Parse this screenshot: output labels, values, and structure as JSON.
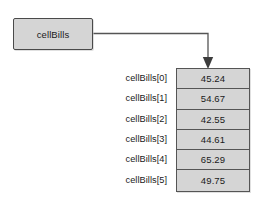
{
  "diagram": {
    "type": "array-reference-diagram",
    "reference": {
      "name": "cellBills",
      "label": "cellBills"
    },
    "arrow": {
      "icon": "arrow-down-icon",
      "from": "cellBills",
      "to": "array-first-cell"
    },
    "array": {
      "name": "cellBills",
      "length": 6,
      "elements": [
        {
          "index_label": "cellBills[0]",
          "value": "45.24"
        },
        {
          "index_label": "cellBills[1]",
          "value": "54.67"
        },
        {
          "index_label": "cellBills[2]",
          "value": "42.55"
        },
        {
          "index_label": "cellBills[3]",
          "value": "44.61"
        },
        {
          "index_label": "cellBills[4]",
          "value": "65.29"
        },
        {
          "index_label": "cellBills[5]",
          "value": "49.75"
        }
      ]
    },
    "colors": {
      "fill": "#d5d5d5",
      "border": "#555555",
      "text": "#1a1a1a",
      "connector": "#555555",
      "background": "#ffffff"
    }
  }
}
